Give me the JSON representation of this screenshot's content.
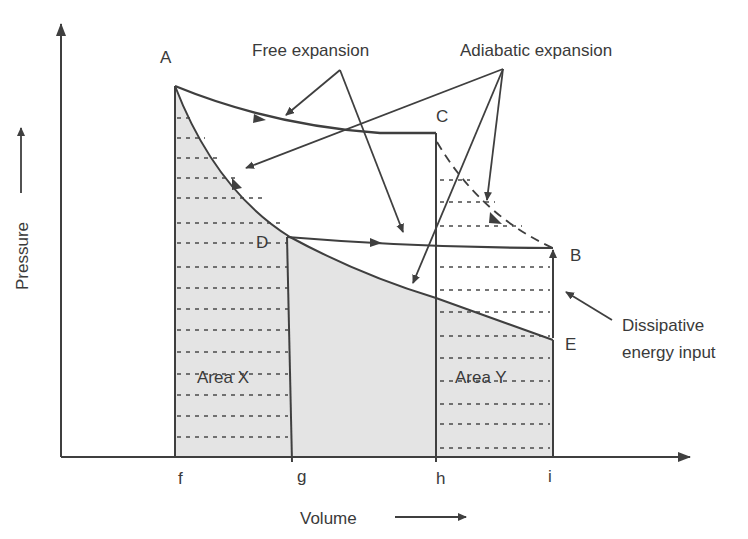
{
  "diagram": {
    "type": "pressure-volume diagram",
    "axes": {
      "y_label": "Pressure",
      "x_label": "Volume"
    },
    "points": {
      "A": "A",
      "B": "B",
      "C": "C",
      "D": "D",
      "E": "E"
    },
    "x_ticks": [
      "f",
      "g",
      "h",
      "i"
    ],
    "areas": {
      "x": "Area X",
      "y": "Area Y"
    },
    "annotations": {
      "free_expansion": "Free expansion",
      "adiabatic_expansion": "Adiabatic expansion",
      "dissipative_line1": "Dissipative",
      "dissipative_line2": "energy input"
    },
    "colors": {
      "line": "#3f3f3f",
      "shade": "#e3e3e3",
      "text": "#3a3a3a"
    }
  }
}
